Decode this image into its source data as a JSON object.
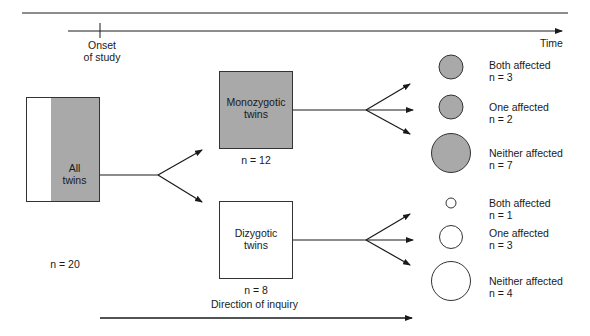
{
  "timeline": {
    "onset_label_line1": "Onset",
    "onset_label_line2": "of study",
    "time_label": "Time"
  },
  "all_twins": {
    "label_line1": "All",
    "label_line2": "twins",
    "n_label": "n = 20"
  },
  "groups": [
    {
      "label_line1": "Monozygotic",
      "label_line2": "twins",
      "n_label": "n = 12",
      "fill": "#a9a9a9",
      "outcomes": [
        {
          "label": "Both affected",
          "n_label": "n = 3"
        },
        {
          "label": "One affected",
          "n_label": "n = 2"
        },
        {
          "label": "Neither affected",
          "n_label": "n = 7"
        }
      ]
    },
    {
      "label_line1": "Dizygotic",
      "label_line2": "twins",
      "n_label": "n = 8",
      "fill": "#ffffff",
      "outcomes": [
        {
          "label": "Both affected",
          "n_label": "n = 1"
        },
        {
          "label": "One affected",
          "n_label": "n = 3"
        },
        {
          "label": "Neither affected",
          "n_label": "n = 4"
        }
      ]
    }
  ],
  "direction": {
    "label": "Direction of inquiry"
  },
  "colors": {
    "shaded": "#a9a9a9",
    "line": "#1a1a1a"
  }
}
